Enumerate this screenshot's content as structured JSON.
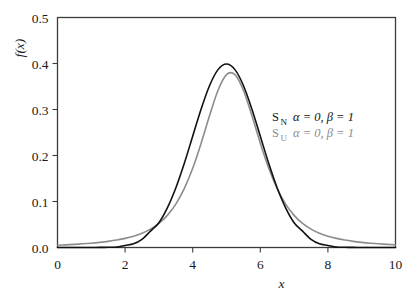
{
  "chart_data": {
    "type": "line",
    "title": "",
    "xlabel": "x",
    "ylabel": "f(x)",
    "xlim": [
      0,
      10
    ],
    "ylim": [
      0.0,
      0.5
    ],
    "grid": false,
    "legend_position": "center-right",
    "xticks": [
      "0",
      "2",
      "4",
      "6",
      "8",
      "10"
    ],
    "xtick_values": [
      0,
      2,
      4,
      6,
      8,
      10
    ],
    "yticks": [
      "0.0",
      "0.1",
      "0.2",
      "0.3",
      "0.4",
      "0.5"
    ],
    "ytick_values": [
      0.0,
      0.1,
      0.2,
      0.3,
      0.4,
      0.5
    ],
    "series": [
      {
        "name": "S_N",
        "label_main": "S",
        "label_sub": "N",
        "params": "α = 0, β = 1",
        "alpha": 0,
        "beta": 1,
        "color": "#111111",
        "linewidth": 1.6,
        "peak_x": 5.0,
        "peak_y": 0.399,
        "x": [
          0.0,
          0.25,
          0.5,
          0.75,
          1.0,
          1.25,
          1.5,
          1.75,
          2.0,
          2.25,
          2.5,
          2.75,
          3.0,
          3.25,
          3.5,
          3.75,
          4.0,
          4.25,
          4.5,
          4.75,
          5.0,
          5.25,
          5.5,
          5.75,
          6.0,
          6.25,
          6.5,
          6.75,
          7.0,
          7.25,
          7.5,
          7.75,
          8.0,
          8.25,
          8.5,
          8.75,
          9.0,
          9.25,
          9.5,
          9.75,
          10.0
        ],
        "y": [
          0.0,
          0.0,
          0.0,
          0.0,
          0.0001,
          0.0002,
          0.0004,
          0.0009,
          0.0044,
          0.0079,
          0.0175,
          0.0355,
          0.054,
          0.0863,
          0.1295,
          0.1826,
          0.242,
          0.3011,
          0.3521,
          0.3867,
          0.3989,
          0.3867,
          0.3521,
          0.3011,
          0.242,
          0.1826,
          0.1295,
          0.0863,
          0.054,
          0.0355,
          0.0175,
          0.0079,
          0.0044,
          0.0009,
          0.0004,
          0.0002,
          0.0001,
          0.0,
          0.0,
          0.0,
          0.0
        ]
      },
      {
        "name": "S_U",
        "label_main": "S",
        "label_sub": "U",
        "params": "α = 0, β = 1",
        "alpha": 0,
        "beta": 1,
        "color": "#8c8c8c",
        "linewidth": 1.6,
        "peak_x": 5.0,
        "peak_y": 0.396,
        "x": [
          0.0,
          0.25,
          0.5,
          0.75,
          1.0,
          1.25,
          1.5,
          1.75,
          2.0,
          2.25,
          2.5,
          2.75,
          3.0,
          3.25,
          3.5,
          3.75,
          4.0,
          4.25,
          4.5,
          4.75,
          5.0,
          5.25,
          5.5,
          5.75,
          6.0,
          6.25,
          6.5,
          6.75,
          7.0,
          7.25,
          7.5,
          7.75,
          8.0,
          8.25,
          8.5,
          8.75,
          9.0,
          9.25,
          9.5,
          9.75,
          10.0
        ],
        "y": [
          0.005,
          0.0058,
          0.0068,
          0.008,
          0.0094,
          0.0112,
          0.0134,
          0.0162,
          0.0198,
          0.0246,
          0.0311,
          0.04,
          0.0524,
          0.0698,
          0.0942,
          0.1278,
          0.1722,
          0.2268,
          0.2868,
          0.342,
          0.376,
          0.376,
          0.342,
          0.2868,
          0.2268,
          0.1722,
          0.1278,
          0.0942,
          0.0698,
          0.0524,
          0.04,
          0.0311,
          0.0246,
          0.0198,
          0.0162,
          0.0134,
          0.0112,
          0.0094,
          0.008,
          0.0068,
          0.0058
        ]
      }
    ],
    "legend": [
      {
        "main": "S",
        "sub": "N",
        "params": "α = 0, β = 1",
        "color": "#111111"
      },
      {
        "main": "S",
        "sub": "U",
        "params": "α = 0, β = 1",
        "color": "#8c8c8c"
      }
    ],
    "axis_color": "#3c3c3c",
    "background": "#ffffff"
  }
}
